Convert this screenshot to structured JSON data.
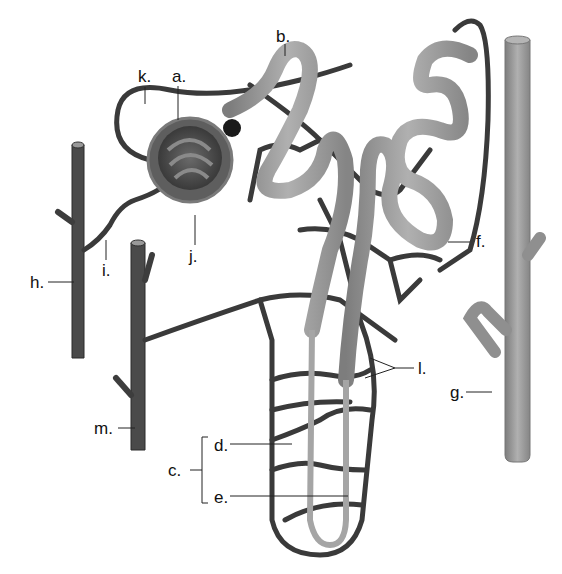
{
  "diagram": {
    "colors": {
      "tubule": "#9a9a9a",
      "vessel": "#3c3c3c",
      "capsule": "#5a5a5a",
      "background": "#ffffff",
      "label": "#111111"
    },
    "labels": [
      {
        "id": "a",
        "text": "a.",
        "x": 172,
        "y": 68
      },
      {
        "id": "b",
        "text": "b.",
        "x": 276,
        "y": 28
      },
      {
        "id": "c",
        "text": "c.",
        "x": 168,
        "y": 462
      },
      {
        "id": "d",
        "text": "d.",
        "x": 214,
        "y": 440
      },
      {
        "id": "e",
        "text": "e.",
        "x": 214,
        "y": 490
      },
      {
        "id": "f",
        "text": "f.",
        "x": 476,
        "y": 233
      },
      {
        "id": "g",
        "text": "g.",
        "x": 452,
        "y": 385
      },
      {
        "id": "h",
        "text": "h.",
        "x": 32,
        "y": 275
      },
      {
        "id": "i",
        "text": "i.",
        "x": 102,
        "y": 263
      },
      {
        "id": "j",
        "text": "j.",
        "x": 187,
        "y": 250
      },
      {
        "id": "k",
        "text": "k.",
        "x": 138,
        "y": 70
      },
      {
        "id": "l",
        "text": "l.",
        "x": 418,
        "y": 368
      },
      {
        "id": "m",
        "text": "m.",
        "x": 96,
        "y": 422
      }
    ]
  }
}
